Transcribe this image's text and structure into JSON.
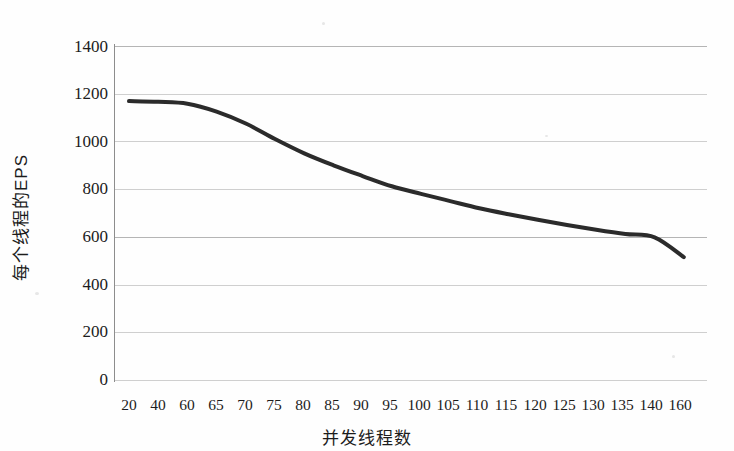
{
  "chart_data": {
    "type": "line",
    "title": "",
    "xlabel": "并发线程数",
    "ylabel": "每个线程的EPS",
    "categories": [
      "20",
      "40",
      "60",
      "65",
      "70",
      "75",
      "80",
      "85",
      "90",
      "95",
      "100",
      "105",
      "110",
      "115",
      "120",
      "125",
      "130",
      "135",
      "140",
      "160"
    ],
    "values": [
      1169,
      1166,
      1158,
      1125,
      1075,
      1010,
      950,
      900,
      855,
      812,
      780,
      750,
      720,
      695,
      672,
      650,
      630,
      612,
      598,
      515
    ],
    "series": [
      {
        "name": "每个线程的EPS",
        "values": [
          1169,
          1166,
          1158,
          1125,
          1075,
          1010,
          950,
          900,
          855,
          812,
          780,
          750,
          720,
          695,
          672,
          650,
          630,
          612,
          598,
          515
        ],
        "color": "#2b2b2b"
      }
    ],
    "ylim": [
      0,
      1400
    ],
    "yticks": [
      0,
      200,
      400,
      600,
      800,
      1000,
      1200,
      1400
    ],
    "ytick_labels": [
      "0",
      "200",
      "400",
      "600",
      "800",
      "1000",
      "1200",
      "1400"
    ],
    "grid": true,
    "grid_color": "#bcbcbc",
    "legend": false,
    "legend_position": "none",
    "background_color": "#ffffff",
    "line_color": "#2b2b2b",
    "line_width": 4
  },
  "axis": {
    "x_title": "并发线程数",
    "y_title": "每个线程的EPS"
  }
}
